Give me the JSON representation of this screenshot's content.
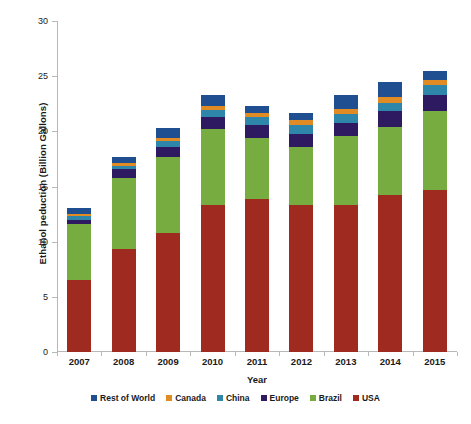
{
  "chart_data": {
    "type": "bar",
    "stacked": true,
    "title": "",
    "xlabel": "Year",
    "ylabel": "Ethanol peduction (Billion Gallons)",
    "ylim": [
      0,
      30
    ],
    "yticks": [
      0,
      5,
      10,
      15,
      20,
      25,
      30
    ],
    "ytick_labels": [
      "0",
      "5",
      "10",
      "15",
      "20",
      "25",
      "30"
    ],
    "grid": false,
    "legend_position": "bottom",
    "categories": [
      "2007",
      "2008",
      "2009",
      "2010",
      "2011",
      "2012",
      "2013",
      "2014",
      "2015"
    ],
    "series": [
      {
        "name": "USA",
        "color": "#9e2a20",
        "values": [
          6.5,
          9.3,
          10.8,
          13.3,
          13.9,
          13.3,
          13.3,
          14.2,
          14.7
        ]
      },
      {
        "name": "Brazil",
        "color": "#77ac41",
        "values": [
          5.1,
          6.5,
          6.9,
          6.9,
          5.5,
          5.3,
          6.3,
          6.2,
          7.1
        ]
      },
      {
        "name": "Europe",
        "color": "#2e1a61",
        "values": [
          0.4,
          0.8,
          0.9,
          1.1,
          1.2,
          1.2,
          1.2,
          1.4,
          1.5
        ]
      },
      {
        "name": "China",
        "color": "#2e86ab",
        "values": [
          0.3,
          0.3,
          0.5,
          0.6,
          0.7,
          0.8,
          0.8,
          0.8,
          0.9
        ]
      },
      {
        "name": "Canada",
        "color": "#e08b23",
        "values": [
          0.2,
          0.2,
          0.3,
          0.4,
          0.4,
          0.4,
          0.4,
          0.5,
          0.5
        ]
      },
      {
        "name": "Rest of World",
        "color": "#1f4f91",
        "values": [
          0.6,
          0.6,
          0.9,
          1.0,
          0.6,
          0.7,
          1.3,
          1.4,
          0.8
        ]
      }
    ],
    "totals": [
      13.1,
      17.7,
      20.3,
      23.3,
      22.3,
      21.7,
      23.3,
      24.5,
      25.5
    ]
  },
  "legend": {
    "items": [
      {
        "label": "Rest of World",
        "color": "#1f4f91"
      },
      {
        "label": "Canada",
        "color": "#e08b23"
      },
      {
        "label": "China",
        "color": "#2e86ab"
      },
      {
        "label": "Europe",
        "color": "#2e1a61"
      },
      {
        "label": "Brazil",
        "color": "#77ac41"
      },
      {
        "label": "USA",
        "color": "#9e2a20"
      }
    ]
  },
  "axes": {
    "y_title": "Ethanol peduction (Billion Gallons)",
    "x_title": "Year"
  }
}
